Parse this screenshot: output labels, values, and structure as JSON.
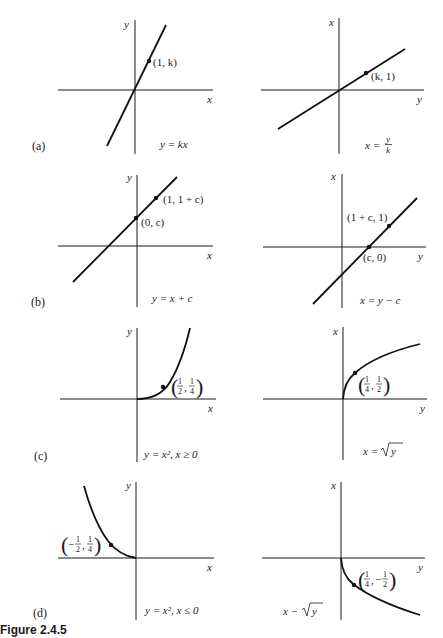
{
  "figure": {
    "caption": "Figure 2.4.5",
    "panels": [
      {
        "id": "a",
        "label": "(a)",
        "left": {
          "x_axis_label": "x",
          "y_axis_label": "y",
          "equation": "y = kx",
          "point_label": "(1, k)"
        },
        "right": {
          "x_axis_label": "y",
          "y_axis_label": "x",
          "equation_lhs": "x =",
          "equation_num": "y",
          "equation_den": "k",
          "point_label": "(k, 1)"
        }
      },
      {
        "id": "b",
        "label": "(b)",
        "left": {
          "x_axis_label": "x",
          "y_axis_label": "y",
          "equation": "y = x + c",
          "point1_label": "(1, 1 + c)",
          "point2_label": "(0, c)"
        },
        "right": {
          "x_axis_label": "y",
          "y_axis_label": "x",
          "equation": "x = y − c",
          "point1_label": "(1 + c, 1)",
          "point2_label": "(c, 0)"
        }
      },
      {
        "id": "c",
        "label": "(c)",
        "left": {
          "x_axis_label": "x",
          "y_axis_label": "y",
          "equation": "y = x², x ≥ 0",
          "point_x_num": "1",
          "point_x_den": "2",
          "point_y_num": "1",
          "point_y_den": "4"
        },
        "right": {
          "x_axis_label": "y",
          "y_axis_label": "x",
          "equation_lhs": "x =",
          "equation_sqrt_arg": "y",
          "point_x_num": "1",
          "point_x_den": "4",
          "point_y_num": "1",
          "point_y_den": "2"
        }
      },
      {
        "id": "d",
        "label": "(d)",
        "left": {
          "x_axis_label": "x",
          "y_axis_label": "y",
          "equation": "y = x², x ≤ 0",
          "point_x_sign": "−",
          "point_x_num": "1",
          "point_x_den": "2",
          "point_y_num": "1",
          "point_y_den": "4"
        },
        "right": {
          "x_axis_label": "y",
          "y_axis_label": "x",
          "equation_lhs": "x −",
          "equation_sqrt_arg": "y",
          "point_x_num": "1",
          "point_x_den": "4",
          "point_y_sign": "−",
          "point_y_num": "1",
          "point_y_den": "2"
        }
      }
    ],
    "comma": ","
  }
}
